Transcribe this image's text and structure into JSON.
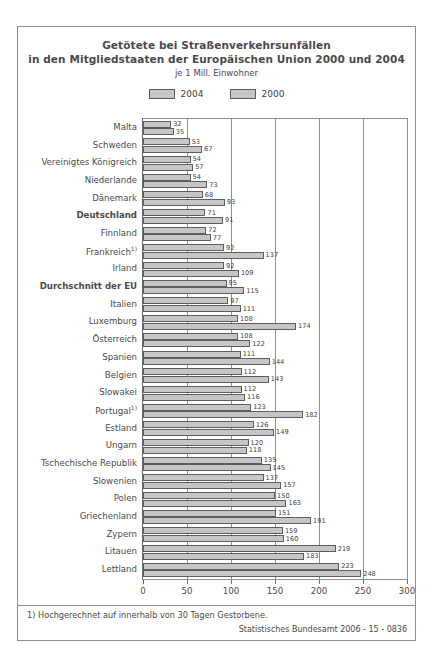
{
  "chart_data": {
    "type": "bar",
    "orientation": "horizontal",
    "title": "Getötete bei Straßenverkehrsunfällen\nin den Mitgliedstaaten der Europäischen Union 2000 und 2004",
    "title_lines": [
      "Getötete bei Straßenverkehrsunfällen",
      "in den Mitgliedstaaten der Europäischen Union 2000 und 2004"
    ],
    "subtitle": "je 1 Mill. Einwohner",
    "xlabel": "",
    "ylabel": "",
    "xlim": [
      0,
      300
    ],
    "xticks": [
      0,
      50,
      100,
      150,
      200,
      250,
      300
    ],
    "xtick_labels": [
      "0",
      "50",
      "100",
      "150",
      "200",
      "250",
      "300"
    ],
    "grid": true,
    "grid_axis": "x",
    "legend_position": "top-center",
    "legend": [
      "2004",
      "2000"
    ],
    "categories": [
      "Malta",
      "Schweden",
      "Vereinigtes Königreich",
      "Niederlande",
      "Dänemark",
      "Deutschland",
      "Finnland",
      "Frankreich",
      "Irland",
      "Durchschnitt der EU",
      "Italien",
      "Luxemburg",
      "Österreich",
      "Spanien",
      "Belgien",
      "Slowakei",
      "Portugal",
      "Estland",
      "Ungarn",
      "Tschechische Republik",
      "Slowenien",
      "Polen",
      "Griechenland",
      "Zypern",
      "Litauen",
      "Lettland"
    ],
    "category_footnote_marks": {
      "Frankreich": "1)",
      "Portugal": "1)"
    },
    "category_emphasis": [
      "Deutschland",
      "Durchschnitt der EU"
    ],
    "series": [
      {
        "name": "2004",
        "color": "#c6c6c6",
        "values": [
          32,
          53,
          54,
          54,
          68,
          71,
          72,
          92,
          92,
          95,
          97,
          108,
          108,
          111,
          112,
          112,
          123,
          126,
          120,
          135,
          137,
          150,
          151,
          159,
          219,
          223
        ]
      },
      {
        "name": "2000",
        "color": "#c6c6c6",
        "values": [
          35,
          67,
          57,
          73,
          93,
          91,
          77,
          137,
          109,
          115,
          111,
          174,
          122,
          144,
          143,
          116,
          182,
          149,
          118,
          145,
          157,
          163,
          191,
          160,
          183,
          248
        ]
      }
    ]
  },
  "footnote": "1) Hochgerechnet auf innerhalb von 30 Tagen Gestorbene.",
  "source": "Statistisches Bundesamt 2006 - 15 - 0836"
}
